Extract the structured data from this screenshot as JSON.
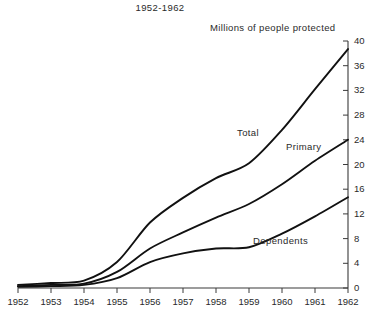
{
  "chart_data": {
    "type": "line",
    "title": "1952-1962",
    "ylabel": "Millions of people protected",
    "xlabel": "",
    "grid": false,
    "legend_position": "inline-annotations",
    "axis_side": "right",
    "x": [
      1952,
      1953,
      1954,
      1955,
      1956,
      1957,
      1958,
      1959,
      1960,
      1961,
      1962
    ],
    "xtick_labels": [
      "1952",
      "1953",
      "1954",
      "1955",
      "1956",
      "1957",
      "1958",
      "1959",
      "1960",
      "1961",
      "1962"
    ],
    "xlim": [
      1952,
      1962
    ],
    "ytick_labels": [
      "0",
      "4",
      "8",
      "12",
      "16",
      "20",
      "24",
      "28",
      "32",
      "36",
      "40"
    ],
    "yticks": [
      0,
      4,
      8,
      12,
      16,
      20,
      24,
      28,
      32,
      36,
      40
    ],
    "ylim": [
      0,
      40
    ],
    "series": [
      {
        "name": "Total",
        "label": "Total",
        "color": "#111111",
        "values": [
          0.5,
          0.8,
          1.2,
          4.2,
          10.6,
          14.6,
          17.8,
          20.2,
          25.6,
          32.2,
          38.7
        ]
      },
      {
        "name": "Primary",
        "label": "Primary",
        "color": "#111111",
        "values": [
          0.3,
          0.5,
          0.7,
          2.6,
          6.4,
          9.0,
          11.4,
          13.6,
          16.8,
          20.6,
          24.0
        ]
      },
      {
        "name": "Dependents",
        "label": "Dependents",
        "color": "#111111",
        "values": [
          0.2,
          0.3,
          0.5,
          1.6,
          4.2,
          5.6,
          6.4,
          6.6,
          8.8,
          11.6,
          14.7
        ]
      }
    ],
    "annotations": [
      {
        "text": "Total",
        "x": 1959.0,
        "y": 21.5
      },
      {
        "text": "Primary",
        "x": 1960.5,
        "y": 19.0
      },
      {
        "text": "Dependents",
        "x": 1959.5,
        "y": 6.0
      }
    ]
  }
}
